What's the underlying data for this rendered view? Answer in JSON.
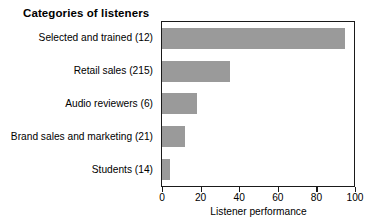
{
  "chart_data": {
    "type": "bar",
    "orientation": "horizontal",
    "title": "Categories of listeners",
    "xlabel": "Listener performance",
    "ylabel": "",
    "categories": [
      "Selected and trained (12)",
      "Retail sales (215)",
      "Audio reviewers (6)",
      "Brand sales and marketing (21)",
      "Students (14)"
    ],
    "values": [
      95,
      35,
      18,
      12,
      4
    ],
    "xlim": [
      0,
      100
    ],
    "xticks": [
      0,
      20,
      40,
      60,
      80,
      100
    ],
    "xticklabels": [
      "0",
      "20",
      "40",
      "60",
      "80",
      "100"
    ],
    "grid": false,
    "legend": null,
    "bar_color": "#9a9a9a",
    "frame_color": "#1a1a1a",
    "background": "#ffffff"
  }
}
